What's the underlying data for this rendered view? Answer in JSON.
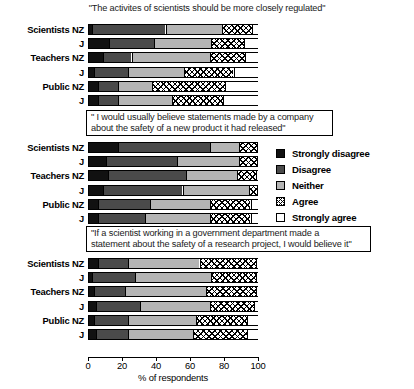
{
  "chart_data": {
    "type": "bar",
    "orientation": "horizontal",
    "stacked": true,
    "stacked_mode": "percent",
    "title": "",
    "xlabel": "% of respondents",
    "ylabel": "",
    "xlim": [
      0,
      100
    ],
    "xticks": [
      0,
      20,
      40,
      60,
      80,
      100
    ],
    "xtick_labels": [
      "0",
      "20",
      "40",
      "60",
      "80",
      "100"
    ],
    "grid": false,
    "legend_position": "right-middle",
    "legend": [
      {
        "key": "strongly_disagree",
        "label": "Strongly disagree",
        "fill": "solid-black",
        "color": "#111111"
      },
      {
        "key": "disagree",
        "label": "Disagree",
        "fill": "solid-dark-gray",
        "color": "#4a4a4a"
      },
      {
        "key": "neither",
        "label": "Neither",
        "fill": "solid-light-gray",
        "color": "#b4b4b4"
      },
      {
        "key": "agree",
        "label": "Agree",
        "fill": "cross-hatched",
        "color": "#ffffff"
      },
      {
        "key": "strongly_agree",
        "label": "Strongly agree",
        "fill": "solid-white",
        "color": "#ffffff"
      }
    ],
    "categories": [
      "Strongly disagree",
      "Disagree",
      "Neither",
      "Agree",
      "Strongly agree"
    ],
    "panels": [
      {
        "id": "panel-regulation",
        "title": "\"The activites of scientists should be more closely regulated\"",
        "boxed_title": false,
        "groups": [
          "Scientists NZ",
          "J",
          "Teachers NZ",
          "J",
          "Public NZ",
          "J"
        ],
        "series": [
          {
            "name": "Scientists NZ",
            "values": [
              2,
              43,
              33,
              18,
              4
            ]
          },
          {
            "name": "J",
            "values": [
              12,
              26,
              34,
              19,
              9
            ]
          },
          {
            "name": "Teachers NZ",
            "values": [
              8,
              17,
              46,
              21,
              8
            ]
          },
          {
            "name": "J",
            "values": [
              3,
              20,
              33,
              29,
              15
            ]
          },
          {
            "name": "Public NZ",
            "values": [
              5,
              12,
              20,
              43,
              20
            ]
          },
          {
            "name": "J",
            "values": [
              5,
              12,
              32,
              30,
              21
            ]
          }
        ]
      },
      {
        "id": "panel-company-product",
        "title": "\" I would usually believe statements made by a company about the safety of a new product it had released\"",
        "title_line1": "\" I would usually believe statements made by a company",
        "title_line2": "about the safety of a new product it had released\"",
        "boxed_title": true,
        "groups": [
          "Scientists NZ",
          "J",
          "Teachers NZ",
          "J",
          "Public NZ",
          "J"
        ],
        "series": [
          {
            "name": "Scientists NZ",
            "values": [
              17,
              54,
              17,
              11,
              1
            ]
          },
          {
            "name": "J",
            "values": [
              10,
              42,
              36,
              11,
              1
            ]
          },
          {
            "name": "Teachers NZ",
            "values": [
              11,
              46,
              30,
              11,
              2
            ]
          },
          {
            "name": "J",
            "values": [
              8,
              47,
              39,
              5,
              1
            ]
          },
          {
            "name": "Public NZ",
            "values": [
              5,
              31,
              35,
              24,
              5
            ]
          },
          {
            "name": "J",
            "values": [
              5,
              28,
              38,
              24,
              5
            ]
          }
        ]
      },
      {
        "id": "panel-government-scientist",
        "title": "\"If a scientist working in a government department made a statement about the safety of a research project, I would believe it\"",
        "title_line1": "\"If a scientist working in a government department made a",
        "title_line2": "statement about the safety of a research project, I would believe it\"",
        "boxed_title": true,
        "groups": [
          "Scientists NZ",
          "J",
          "Teachers NZ",
          "J",
          "Public NZ",
          "J"
        ],
        "series": [
          {
            "name": "Scientists NZ",
            "values": [
              5,
              18,
              42,
              33,
              2
            ]
          },
          {
            "name": "J",
            "values": [
              2,
              25,
              45,
              26,
              2
            ]
          },
          {
            "name": "Teachers NZ",
            "values": [
              3,
              18,
              48,
              29,
              2
            ]
          },
          {
            "name": "J",
            "values": [
              4,
              26,
              41,
              26,
              3
            ]
          },
          {
            "name": "Public NZ",
            "values": [
              3,
              20,
              40,
              30,
              7
            ]
          },
          {
            "name": "J",
            "values": [
              4,
              19,
              38,
              32,
              7
            ]
          }
        ]
      }
    ]
  }
}
